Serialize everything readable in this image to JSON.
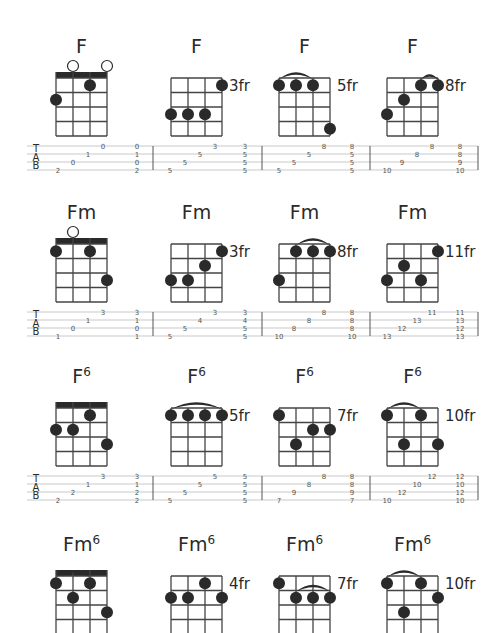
{
  "colors": {
    "ink": "#2a2a2a",
    "grid": "#444444",
    "tab_line": "#bbbbbb",
    "tab_text": "#555555"
  },
  "tab_labels": [
    "T",
    "A",
    "B"
  ],
  "rows": [
    {
      "top": 0,
      "chords": [
        {
          "name": "F",
          "sup": "",
          "fret_label": "",
          "nut": true,
          "open": [
            2,
            4
          ],
          "dots": [
            [
              3,
              1
            ],
            [
              1,
              2
            ]
          ],
          "arcs": []
        },
        {
          "name": "F",
          "sup": "",
          "fret_label": "3fr",
          "nut": false,
          "open": [],
          "dots": [
            [
              4,
              1
            ],
            [
              1,
              3
            ],
            [
              2,
              3
            ],
            [
              3,
              3
            ]
          ],
          "arcs": []
        },
        {
          "name": "F",
          "sup": "",
          "fret_label": "5fr",
          "nut": false,
          "open": [],
          "dots": [
            [
              1,
              1
            ],
            [
              2,
              1
            ],
            [
              3,
              1
            ],
            [
              4,
              4
            ]
          ],
          "arcs": [
            [
              1,
              3
            ]
          ]
        },
        {
          "name": "F",
          "sup": "",
          "fret_label": "8fr",
          "nut": false,
          "open": [],
          "dots": [
            [
              3,
              1
            ],
            [
              4,
              1
            ],
            [
              2,
              2
            ],
            [
              1,
              3
            ]
          ],
          "arcs": [
            [
              3,
              4
            ]
          ]
        }
      ],
      "tab": [
        {
          "notes": [
            [
              "2",
              "0",
              "1",
              "0"
            ]
          ],
          "chord": [
            "2",
            "0",
            "1",
            "0"
          ]
        },
        {
          "notes": [
            [
              "5",
              "5",
              "5",
              "3"
            ]
          ],
          "chord": [
            "5",
            "5",
            "5",
            "3"
          ]
        },
        {
          "notes": [
            [
              "5",
              "5",
              "5",
              "8"
            ]
          ],
          "chord": [
            "5",
            "5",
            "5",
            "8"
          ]
        },
        {
          "notes": [
            [
              "10",
              "9",
              "8",
              "8"
            ]
          ],
          "chord": [
            "10",
            "9",
            "8",
            "8"
          ]
        }
      ]
    },
    {
      "top": 166,
      "chords": [
        {
          "name": "Fm",
          "sup": "",
          "fret_label": "",
          "nut": true,
          "open": [
            2
          ],
          "dots": [
            [
              1,
              1
            ],
            [
              3,
              1
            ],
            [
              4,
              3
            ]
          ],
          "arcs": []
        },
        {
          "name": "Fm",
          "sup": "",
          "fret_label": "3fr",
          "nut": false,
          "open": [],
          "dots": [
            [
              4,
              1
            ],
            [
              3,
              2
            ],
            [
              1,
              3
            ],
            [
              2,
              3
            ]
          ],
          "arcs": []
        },
        {
          "name": "Fm",
          "sup": "",
          "fret_label": "8fr",
          "nut": false,
          "open": [],
          "dots": [
            [
              2,
              1
            ],
            [
              3,
              1
            ],
            [
              4,
              1
            ],
            [
              1,
              3
            ]
          ],
          "arcs": [
            [
              2,
              4
            ]
          ]
        },
        {
          "name": "Fm",
          "sup": "",
          "fret_label": "11fr",
          "nut": false,
          "open": [],
          "dots": [
            [
              4,
              1
            ],
            [
              2,
              2
            ],
            [
              1,
              3
            ],
            [
              3,
              3
            ]
          ],
          "arcs": []
        }
      ],
      "tab": [
        {
          "chord": [
            "1",
            "0",
            "1",
            "3"
          ]
        },
        {
          "chord": [
            "5",
            "5",
            "4",
            "3"
          ]
        },
        {
          "chord": [
            "10",
            "8",
            "8",
            "8"
          ]
        },
        {
          "chord": [
            "13",
            "12",
            "13",
            "11"
          ]
        }
      ]
    },
    {
      "top": 330,
      "chords": [
        {
          "name": "F",
          "sup": "6",
          "fret_label": "",
          "nut": true,
          "open": [],
          "dots": [
            [
              3,
              1
            ],
            [
              1,
              2
            ],
            [
              2,
              2
            ],
            [
              4,
              3
            ]
          ],
          "arcs": []
        },
        {
          "name": "F",
          "sup": "6",
          "fret_label": "5fr",
          "nut": false,
          "open": [],
          "dots": [
            [
              1,
              1
            ],
            [
              2,
              1
            ],
            [
              3,
              1
            ],
            [
              4,
              1
            ]
          ],
          "arcs": [
            [
              1,
              4
            ]
          ]
        },
        {
          "name": "F",
          "sup": "6",
          "fret_label": "7fr",
          "nut": false,
          "open": [],
          "dots": [
            [
              1,
              1
            ],
            [
              3,
              2
            ],
            [
              4,
              2
            ],
            [
              2,
              3
            ]
          ],
          "arcs": []
        },
        {
          "name": "F",
          "sup": "6",
          "fret_label": "10fr",
          "nut": false,
          "open": [],
          "dots": [
            [
              1,
              1
            ],
            [
              3,
              1
            ],
            [
              2,
              3
            ],
            [
              4,
              3
            ]
          ],
          "arcs": [
            [
              1,
              3
            ]
          ]
        }
      ],
      "tab": [
        {
          "chord": [
            "2",
            "2",
            "1",
            "3"
          ]
        },
        {
          "chord": [
            "5",
            "5",
            "5",
            "5"
          ]
        },
        {
          "chord": [
            "7",
            "9",
            "8",
            "8"
          ]
        },
        {
          "chord": [
            "10",
            "12",
            "10",
            "12"
          ]
        }
      ]
    },
    {
      "top": 498,
      "chords": [
        {
          "name": "Fm",
          "sup": "6",
          "fret_label": "",
          "nut": true,
          "open": [],
          "dots": [
            [
              1,
              1
            ],
            [
              3,
              1
            ],
            [
              2,
              2
            ],
            [
              4,
              3
            ]
          ],
          "arcs": [
            [
              1,
              3
            ]
          ]
        },
        {
          "name": "Fm",
          "sup": "6",
          "fret_label": "4fr",
          "nut": false,
          "open": [],
          "dots": [
            [
              3,
              1
            ],
            [
              1,
              2
            ],
            [
              2,
              2
            ],
            [
              4,
              2
            ]
          ],
          "arcs": []
        },
        {
          "name": "Fm",
          "sup": "6",
          "fret_label": "7fr",
          "nut": false,
          "open": [],
          "dots": [
            [
              1,
              1
            ],
            [
              2,
              2
            ],
            [
              3,
              2
            ],
            [
              4,
              2
            ]
          ],
          "arcs": [
            [
              2,
              4
            ]
          ]
        },
        {
          "name": "Fm",
          "sup": "6",
          "fret_label": "10fr",
          "nut": false,
          "open": [],
          "dots": [
            [
              1,
              1
            ],
            [
              3,
              1
            ],
            [
              4,
              2
            ],
            [
              2,
              3
            ]
          ],
          "arcs": [
            [
              1,
              3
            ]
          ]
        }
      ],
      "tab": null
    }
  ]
}
